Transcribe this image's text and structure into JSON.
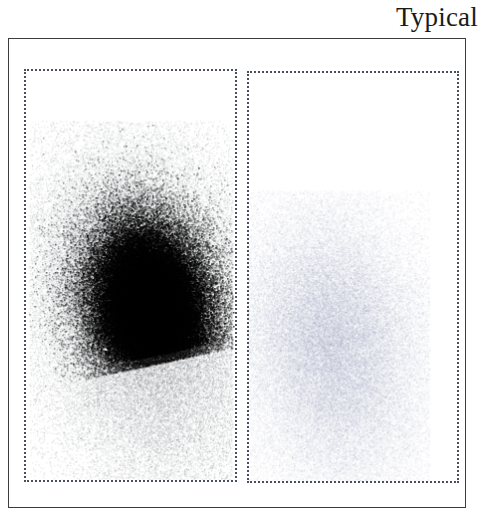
{
  "figure": {
    "title": "Typical",
    "type": "flow-cytometry-density-plot",
    "background_color": "#ffffff",
    "frame_color": "#3c3c3c",
    "gate_color": "#4a4f5c"
  },
  "gates": [
    {
      "name": "left-gate",
      "label": "",
      "x": 23,
      "y": 68,
      "width": 213,
      "height": 413,
      "style": "dotted"
    },
    {
      "name": "right-gate",
      "label": "",
      "x": 246,
      "y": 70,
      "width": 212,
      "height": 412,
      "style": "dotted"
    }
  ],
  "chart_data": {
    "type": "scatter",
    "title": "Typical",
    "xlabel": "",
    "ylabel": "",
    "xlim": [
      0,
      482
    ],
    "ylim": [
      0,
      501
    ],
    "grid": false,
    "legend": "none",
    "rendering": "density-shaded dot plot, darker = higher event density",
    "series": [
      {
        "name": "left-population",
        "gate": "left-gate",
        "color": "#101010",
        "peak_density": 1.0,
        "centroid": [
          150,
          310
        ],
        "core": {
          "cx": 150,
          "cy": 310,
          "rx": 52,
          "ry": 75,
          "rotation_deg": -12
        },
        "halo": {
          "cx": 140,
          "cy": 300,
          "rx": 105,
          "ry": 150,
          "rotation_deg": -12
        },
        "extent": {
          "x_min": 28,
          "x_max": 232,
          "y_min": 120,
          "y_max": 480
        },
        "relative_event_count": 1.0
      },
      {
        "name": "right-population",
        "gate": "right-gate",
        "color": "#9aa0b4",
        "peak_density": 0.22,
        "centroid": [
          335,
          345
        ],
        "core": {
          "cx": 335,
          "cy": 345,
          "rx": 72,
          "ry": 105,
          "rotation_deg": -10
        },
        "halo": {
          "cx": 330,
          "cy": 345,
          "rx": 100,
          "ry": 150,
          "rotation_deg": -10
        },
        "extent": {
          "x_min": 247,
          "x_max": 430,
          "y_min": 190,
          "y_max": 482
        },
        "relative_event_count": 0.38
      }
    ]
  }
}
